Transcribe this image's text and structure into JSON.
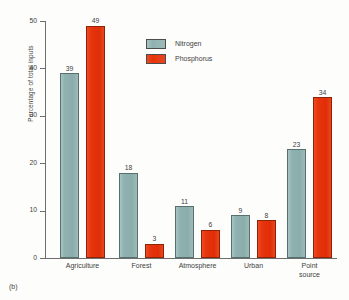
{
  "caption": "(b)",
  "chart_data": {
    "type": "bar",
    "title": "",
    "xlabel": "",
    "ylabel": "Percentage of total inputs",
    "ylim": [
      0,
      50
    ],
    "yticks": [
      0,
      10,
      20,
      30,
      40,
      50
    ],
    "ytick_labels": [
      "0",
      "10",
      "20",
      "30",
      "40",
      "50"
    ],
    "grid": false,
    "legend_position": "upper-center",
    "categories": [
      "Agriculture",
      "Forest",
      "Atmosphere",
      "Urban",
      "Point\nsource"
    ],
    "series": [
      {
        "name": "Nitrogen",
        "color": "#8fb2b0",
        "values": [
          39,
          18,
          11,
          9,
          23
        ],
        "labels": [
          "39",
          "18",
          "11",
          "9",
          "23"
        ]
      },
      {
        "name": "Phosphorus",
        "color": "#e6340c",
        "values": [
          49,
          3,
          6,
          8,
          34
        ],
        "labels": [
          "49",
          "3",
          "6",
          "8",
          "34"
        ]
      }
    ]
  }
}
